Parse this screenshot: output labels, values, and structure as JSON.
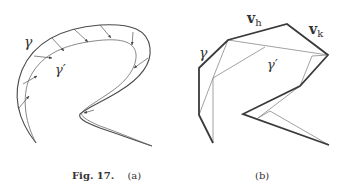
{
  "figure": {
    "number_label": "Fig. 17.",
    "panels": [
      {
        "id": "a",
        "label": "(a)",
        "curve_labels": {
          "outer": "γ",
          "inner": "γ′"
        },
        "description": "Smooth curve γ with arrows pointing to a nearby curve γ′"
      },
      {
        "id": "b",
        "label": "(b)",
        "curve_labels": {
          "outer": "γ",
          "inner": "γ′",
          "edge_h": "v",
          "edge_h_sub": "h",
          "edge_k": "v",
          "edge_k_sub": "k"
        },
        "description": "Polygonal approximation with thick polygon γ and thin triangulation γ′"
      }
    ]
  },
  "colors": {
    "thick_stroke": "#3a3a3a",
    "thin_stroke": "#777777",
    "text": "#333333",
    "background": "#ffffff"
  }
}
